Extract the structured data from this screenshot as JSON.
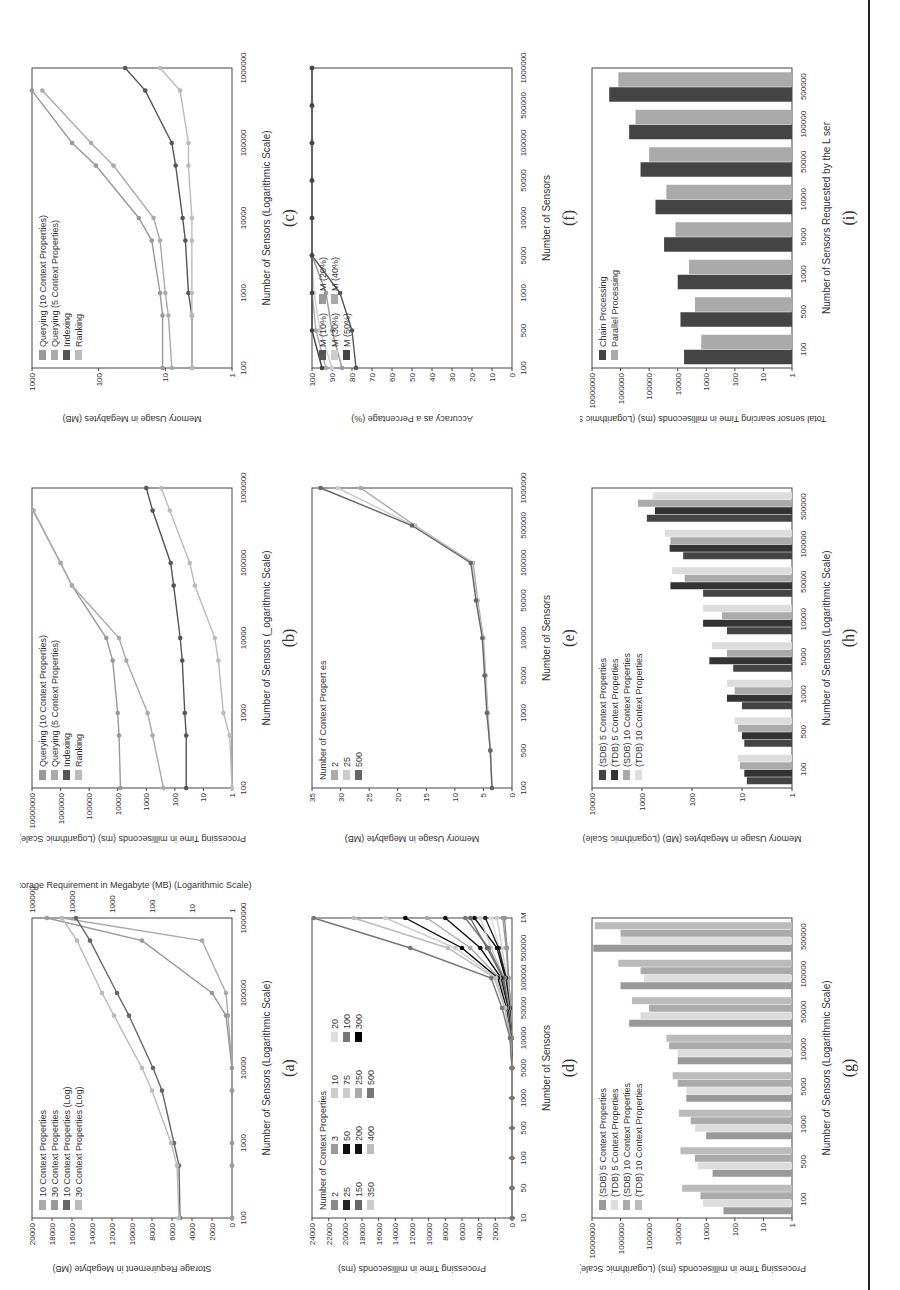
{
  "chart_data": [
    {
      "id": "a",
      "caption": "(a)",
      "type": "line",
      "xlabel": "Number of Sensors (Logarithmic Scale)",
      "ylabel": "Storage Requirement in Megabyte (MB)",
      "y2label": "Storage Requirement in Megabyte (MB) (Logarithmic Scale)",
      "x": [
        "100",
        "1000",
        "10000",
        "100000",
        "1000000"
      ],
      "x_points": [
        100,
        500,
        1000,
        5000,
        10000,
        50000,
        100000,
        500000,
        1000000
      ],
      "yticks": [
        0,
        2000,
        4000,
        6000,
        8000,
        10000,
        12000,
        14000,
        16000,
        18000,
        20000
      ],
      "y2ticks": [
        "1",
        "10",
        "100",
        "1000",
        "10000",
        "100000"
      ],
      "ylim": [
        0,
        20000
      ],
      "series": [
        {
          "name": "10 Context Properties",
          "values": [
            0,
            0,
            0,
            0,
            0,
            400,
            600,
            3000,
            17000
          ],
          "color": "#aaaaaa"
        },
        {
          "name": "30 Context Properties",
          "values": [
            0,
            0,
            0,
            0,
            10,
            600,
            2000,
            9000,
            18500
          ],
          "color": "#999999"
        },
        {
          "name": "10 Context Properties (Log)",
          "values": [
            5200,
            5300,
            5800,
            7000,
            7900,
            10300,
            11500,
            14200,
            15600
          ],
          "color": "#666666"
        },
        {
          "name": "30 Context Properties (Log)",
          "values": [
            5300,
            5500,
            6100,
            8000,
            9000,
            11800,
            13000,
            15500,
            17000
          ],
          "color": "#bbbbbb"
        }
      ]
    },
    {
      "id": "b",
      "caption": "(b)",
      "type": "line",
      "xlabel": "Number of Sensors (_ogarithmic Scale)",
      "ylabel": "Processing Time in milliseconds (ms) (Logarithmic Scale)",
      "yticks": [
        "1",
        "10",
        "100",
        "1000",
        "10000",
        "100000",
        "1000000",
        "10000000"
      ],
      "x_ticks": [
        "100",
        "1000",
        "10000",
        "100000",
        "1000000"
      ],
      "x_points": [
        100,
        500,
        1000,
        5000,
        10000,
        50000,
        100000,
        500000,
        1000000
      ],
      "series": [
        {
          "name": "Querying (10 Context Properties)",
          "values": [
            8000,
            9000,
            10000,
            15000,
            25000,
            400000,
            1000000,
            9000000,
            null
          ],
          "color": "#999999"
        },
        {
          "name": "Querying (5 Context Properties)",
          "values": [
            250,
            600,
            900,
            5000,
            9000,
            400000,
            1000000,
            9000000,
            null
          ],
          "color": "#aaaaaa"
        },
        {
          "name": "Indexing",
          "values": [
            40,
            40,
            45,
            55,
            65,
            110,
            140,
            600,
            1000
          ],
          "color": "#555555"
        },
        {
          "name": "Ranking",
          "values": [
            1,
            1.2,
            2,
            3,
            4,
            20,
            30,
            150,
            300
          ],
          "color": "#bbbbbb"
        }
      ]
    },
    {
      "id": "c",
      "caption": "(c)",
      "type": "line",
      "xlabel": "Number of Sensors (Logarithmic Scale)",
      "ylabel": "Memory Usage in Megabytes (MB)",
      "yticks": [
        "1",
        "10",
        "100",
        "1000"
      ],
      "x_ticks": [
        "100",
        "1000",
        "10000",
        "100000",
        "1000000"
      ],
      "x_points": [
        100,
        500,
        1000,
        5000,
        10000,
        50000,
        100000,
        500000,
        1000000
      ],
      "series": [
        {
          "name": "Querying (10 Context Properties)",
          "values": [
            11,
            11,
            12,
            16,
            25,
            110,
            250,
            1000,
            null
          ],
          "color": "#999999"
        },
        {
          "name": "Querying (5 Context Properties)",
          "values": [
            8,
            9,
            10,
            12,
            15,
            60,
            130,
            700,
            null
          ],
          "color": "#aaaaaa"
        },
        {
          "name": "Indexing",
          "values": [
            4,
            4,
            4.5,
            5,
            5.5,
            7,
            8,
            20,
            40
          ],
          "color": "#555555"
        },
        {
          "name": "Ranking",
          "values": [
            4,
            4,
            4,
            4,
            4,
            4.5,
            4.5,
            6,
            12
          ],
          "color": "#bbbbbb"
        }
      ]
    },
    {
      "id": "d",
      "caption": "(d)",
      "type": "line",
      "xlabel": "Number of Sensors",
      "ylabel": "Processing Time in milliseconds (ms)",
      "x": [
        "10",
        "50",
        "100",
        "500",
        "1000",
        "5000",
        "10000",
        "50000",
        "100000",
        "500000",
        "1M"
      ],
      "yticks": [
        0,
        2000,
        4000,
        6000,
        8000,
        10000,
        12000,
        14000,
        16000,
        18000,
        20000,
        22000,
        24000
      ],
      "ylim": [
        0,
        24000
      ],
      "legend_title": "Number of Context Properties",
      "series": [
        {
          "name": "2",
          "values": [
            0,
            0,
            0,
            0,
            0,
            0,
            50,
            150,
            400,
            600,
            900
          ],
          "color": "#888888"
        },
        {
          "name": "3",
          "values": [
            0,
            0,
            0,
            0,
            0,
            0,
            50,
            150,
            450,
            700,
            1100
          ],
          "color": "#999999"
        },
        {
          "name": "10",
          "values": [
            0,
            0,
            0,
            0,
            0,
            0,
            60,
            200,
            600,
            1200,
            1800
          ],
          "color": "#cccccc"
        },
        {
          "name": "20",
          "values": [
            0,
            0,
            0,
            0,
            0,
            0,
            60,
            250,
            700,
            1500,
            2500
          ],
          "color": "#dddddd"
        },
        {
          "name": "25",
          "values": [
            0,
            0,
            0,
            0,
            0,
            0,
            60,
            250,
            700,
            1600,
            3200
          ],
          "color": "#222222"
        },
        {
          "name": "50",
          "values": [
            0,
            0,
            0,
            0,
            0,
            0,
            70,
            300,
            800,
            1800,
            4500
          ],
          "color": "#111111"
        },
        {
          "name": "75",
          "values": [
            0,
            0,
            0,
            0,
            0,
            0,
            80,
            350,
            900,
            2500,
            3800
          ],
          "color": "#cccccc"
        },
        {
          "name": "100",
          "values": [
            0,
            0,
            0,
            0,
            0,
            0,
            90,
            400,
            1000,
            2800,
            5600
          ],
          "color": "#777777"
        },
        {
          "name": "150",
          "values": [
            0,
            0,
            0,
            0,
            0,
            0,
            100,
            450,
            1100,
            3000,
            5000
          ],
          "color": "#666666"
        },
        {
          "name": "200",
          "values": [
            0,
            0,
            0,
            0,
            0,
            0,
            120,
            500,
            1300,
            3800,
            8000
          ],
          "color": "#111111"
        },
        {
          "name": "250",
          "values": [
            0,
            0,
            0,
            0,
            0,
            0,
            150,
            600,
            1500,
            5000,
            10200
          ],
          "color": "#aaaaaa"
        },
        {
          "name": "300",
          "values": [
            0,
            0,
            0,
            0,
            0,
            0,
            170,
            700,
            1700,
            6000,
            12800
          ],
          "color": "#000000"
        },
        {
          "name": "350",
          "values": [
            0,
            0,
            0,
            0,
            0,
            0,
            180,
            800,
            1900,
            6800,
            15200
          ],
          "color": "#cccccc"
        },
        {
          "name": "400",
          "values": [
            0,
            0,
            0,
            0,
            0,
            0,
            200,
            900,
            2100,
            7700,
            19000
          ],
          "color": "#bbbbbb"
        },
        {
          "name": "500",
          "values": [
            0,
            0,
            0,
            0,
            0,
            0,
            250,
            1200,
            2500,
            12200,
            23800
          ],
          "color": "#777777"
        }
      ]
    },
    {
      "id": "e",
      "caption": "(e)",
      "type": "line",
      "xlabel": "Number of Sensors",
      "ylabel": "Memory Usage in Megabyte (MB)",
      "x": [
        "100",
        "500",
        "1000",
        "5000",
        "10000",
        "50000",
        "100000",
        "500000",
        "1000000"
      ],
      "yticks": [
        0,
        5,
        10,
        15,
        20,
        25,
        30,
        35
      ],
      "ylim": [
        0,
        35
      ],
      "legend_title": "Number of Context Propert es",
      "series": [
        {
          "name": "2",
          "values": [
            3.5,
            3.8,
            4.2,
            4.6,
            5,
            6,
            6.8,
            17,
            26.5
          ],
          "color": "#aaaaaa"
        },
        {
          "name": "25",
          "values": [
            3.5,
            3.8,
            4.3,
            4.7,
            5.1,
            6.2,
            7,
            17.2,
            30.5
          ],
          "color": "#cccccc"
        },
        {
          "name": "500",
          "values": [
            3.5,
            3.8,
            4.4,
            4.8,
            5.2,
            6.3,
            7.2,
            17.5,
            33.5
          ],
          "color": "#666666"
        }
      ]
    },
    {
      "id": "f",
      "caption": "(f)",
      "type": "line",
      "xlabel": "Number of Sensors",
      "ylabel": "Accuracy as a Percentage (%)",
      "x": [
        "100",
        "500",
        "1000",
        "5000",
        "10000",
        "50000",
        "100000",
        "500000",
        "1000000"
      ],
      "yticks": [
        0,
        10,
        20,
        30,
        40,
        50,
        60,
        70,
        80,
        90,
        100
      ],
      "ylim": [
        0,
        100
      ],
      "series": [
        {
          "name": "M (10%)",
          "values": [
            78,
            80,
            86,
            100,
            100,
            100,
            100,
            100,
            100
          ],
          "color": "#555555"
        },
        {
          "name": "M (20%)",
          "values": [
            85,
            90,
            93,
            100,
            100,
            100,
            100,
            100,
            100
          ],
          "color": "#999999"
        },
        {
          "name": "M (30%)",
          "values": [
            90,
            96,
            99,
            100,
            100,
            100,
            100,
            100,
            100
          ],
          "color": "#cccccc"
        },
        {
          "name": "M (40%)",
          "values": [
            93,
            98,
            100,
            100,
            100,
            100,
            100,
            100,
            100
          ],
          "color": "#aaaaaa"
        },
        {
          "name": "M (50%)",
          "values": [
            95,
            100,
            100,
            100,
            100,
            100,
            100,
            100,
            100
          ],
          "color": "#444444"
        }
      ]
    },
    {
      "id": "g",
      "caption": "(g)",
      "type": "bar",
      "xlabel": "Number of Sensors (Logarithmic Scale)",
      "ylabel": "Processing Time in milliseconds (ms) (Logarithmic Scale)",
      "categories": [
        "100",
        "500",
        "1000",
        "5000",
        "10000",
        "50000",
        "100000",
        "500000"
      ],
      "yticks": [
        "1",
        "10",
        "100",
        "1000",
        "10000",
        "100000",
        "1000000",
        "10000000"
      ],
      "series": [
        {
          "name": "(SDB) 5 Context Properties",
          "values": [
            250,
            600,
            1000,
            5000,
            10000,
            500000,
            1000000,
            9000000
          ],
          "color": "#999999"
        },
        {
          "name": "(TDB) 5 Context Properties",
          "values": [
            1300,
            2000,
            2500,
            5000,
            10000,
            200000,
            150000,
            1000000
          ],
          "color": "#dddddd"
        },
        {
          "name": "(SDB) 10 Context Properties",
          "values": [
            1600,
            2500,
            3500,
            10000,
            20000,
            100000,
            200000,
            1000000
          ],
          "color": "#aaaaaa"
        },
        {
          "name": "(TDB) 10 Context Properties",
          "values": [
            7000,
            8000,
            9000,
            15000,
            25000,
            400000,
            1200000,
            8000000
          ],
          "color": "#bbbbbb"
        }
      ]
    },
    {
      "id": "h",
      "caption": "(h)",
      "type": "bar",
      "xlabel": "Number of Sensors (Logarithmic Scale)",
      "ylabel": "Memory Usage in Megabytes (MB) (Logarithmic Scale)",
      "categories": [
        "100",
        "500",
        "1000",
        "5000",
        "10000",
        "50000",
        "100000",
        "500000"
      ],
      "yticks": [
        "1",
        "10",
        "100",
        "1000",
        "10000"
      ],
      "series": [
        {
          "name": "(SDB) 5 Context Properties",
          "values": [
            8,
            9,
            10,
            15,
            20,
            60,
            150,
            800
          ],
          "color": "#444444"
        },
        {
          "name": "(TDB) 5 Context Properties",
          "values": [
            9,
            10,
            20,
            45,
            60,
            270,
            280,
            550
          ],
          "color": "#333333"
        },
        {
          "name": "(SDB) 10 Context Properties",
          "values": [
            11,
            12,
            14,
            20,
            25,
            140,
            270,
            1200
          ],
          "color": "#aaaaaa"
        },
        {
          "name": "(TDB) 10 Context Properties",
          "values": [
            12,
            14,
            20,
            40,
            60,
            250,
            350,
            600
          ],
          "color": "#dddddd"
        }
      ]
    },
    {
      "id": "i",
      "caption": "(i)",
      "type": "bar",
      "xlabel": "Number of Sensors Requested by the L ser",
      "ylabel": "Total sensor searcing Time in milliseconds (ms) (Logarithmic Scale)",
      "categories": [
        "100",
        "500",
        "1000",
        "5000",
        "10000",
        "50000",
        "100000",
        "500000"
      ],
      "yticks": [
        "1",
        "10",
        "100",
        "1000",
        "10000",
        "100000",
        "1000000",
        "10000000"
      ],
      "series": [
        {
          "name": "Chain Processing",
          "values": [
            6000,
            8000,
            10000,
            30000,
            60000,
            200000,
            500000,
            2500000
          ],
          "color": "#444444"
        },
        {
          "name": "Parallel Processing",
          "values": [
            1500,
            2500,
            4000,
            12000,
            25000,
            100000,
            300000,
            1200000
          ],
          "color": "#aaaaaa"
        }
      ]
    }
  ]
}
